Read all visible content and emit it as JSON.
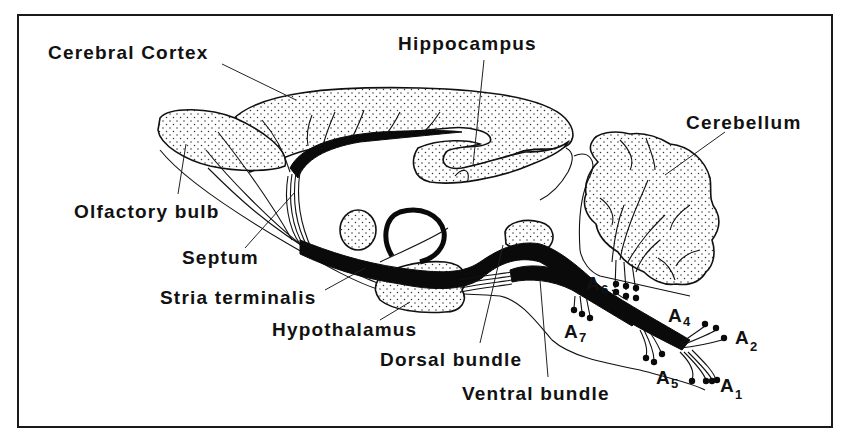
{
  "figure": {
    "labels": {
      "cerebral_cortex": "Cerebral Cortex",
      "hippocampus": "Hippocampus",
      "cerebellum": "Cerebellum",
      "olfactory_bulb": "Olfactory bulb",
      "septum": "Septum",
      "stria_terminalis": "Stria terminalis",
      "hypothalamus": "Hypothalamus",
      "dorsal_bundle": "Dorsal bundle",
      "ventral_bundle": "Ventral bundle"
    },
    "cell_groups": [
      {
        "id": "A1",
        "base": "A",
        "sub": "1"
      },
      {
        "id": "A2",
        "base": "A",
        "sub": "2"
      },
      {
        "id": "A4",
        "base": "A",
        "sub": "4"
      },
      {
        "id": "A5",
        "base": "A",
        "sub": "5"
      },
      {
        "id": "A6",
        "base": "A",
        "sub": "6"
      },
      {
        "id": "A7",
        "base": "A",
        "sub": "7"
      }
    ],
    "colors": {
      "ink": "#111111",
      "background": "#ffffff"
    }
  }
}
